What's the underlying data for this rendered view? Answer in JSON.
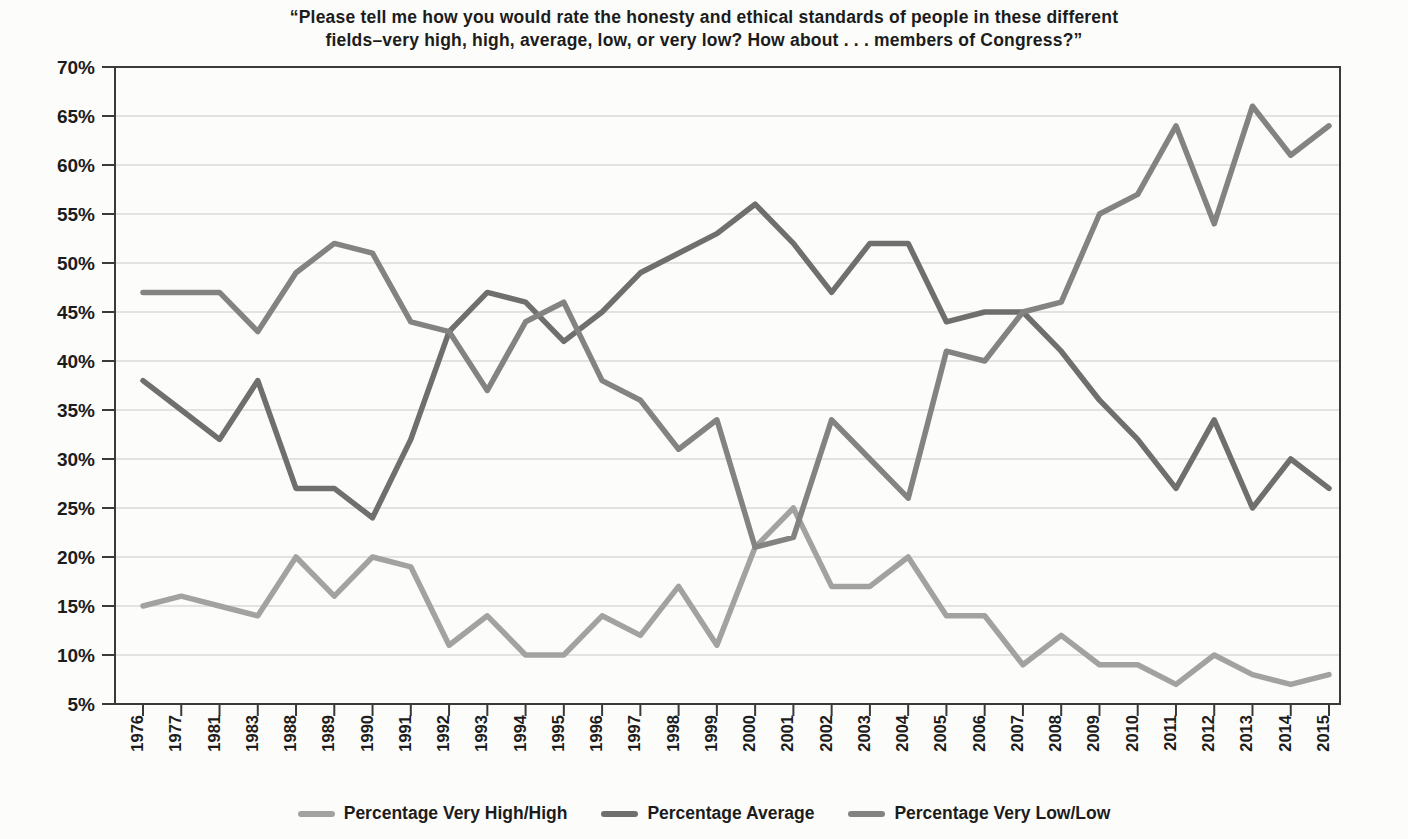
{
  "figure": {
    "title_line1": "“Please tell me how you would rate the honesty and ethical standards of people in these different",
    "title_line2": "fields–very high, high, average, low, or very low? How about . . . members of Congress?”"
  },
  "chart_data": {
    "type": "line",
    "x": [
      1976,
      1977,
      1981,
      1983,
      1988,
      1989,
      1990,
      1991,
      1992,
      1993,
      1994,
      1995,
      1996,
      1997,
      1998,
      1999,
      2000,
      2001,
      2002,
      2003,
      2004,
      2005,
      2006,
      2007,
      2008,
      2009,
      2010,
      2011,
      2012,
      2013,
      2014,
      2015
    ],
    "series": [
      {
        "name": "Percentage Very High/High",
        "color": "#a2a2a0",
        "values": [
          15,
          16,
          15,
          14,
          20,
          16,
          20,
          19,
          11,
          14,
          10,
          10,
          14,
          12,
          17,
          11,
          21,
          25,
          17,
          17,
          20,
          14,
          14,
          9,
          12,
          9,
          9,
          7,
          10,
          8,
          7,
          8
        ]
      },
      {
        "name": "Percentage Average",
        "color": "#6f6f6d",
        "values": [
          38,
          35,
          32,
          38,
          27,
          27,
          24,
          32,
          43,
          47,
          46,
          42,
          45,
          49,
          51,
          53,
          56,
          52,
          47,
          52,
          52,
          44,
          45,
          45,
          41,
          36,
          32,
          27,
          34,
          25,
          30,
          27
        ]
      },
      {
        "name": "Percentage Very Low/Low",
        "color": "#838381",
        "values": [
          47,
          47,
          47,
          43,
          49,
          52,
          51,
          44,
          43,
          37,
          44,
          46,
          38,
          36,
          31,
          34,
          21,
          22,
          34,
          30,
          26,
          41,
          40,
          45,
          46,
          55,
          57,
          64,
          54,
          66,
          61,
          64
        ]
      }
    ],
    "ylim": [
      5,
      70
    ],
    "y_step": 5,
    "y_tick_format": "percent",
    "xlabel": "",
    "ylabel": "",
    "grid": true,
    "legend_position": "bottom"
  }
}
